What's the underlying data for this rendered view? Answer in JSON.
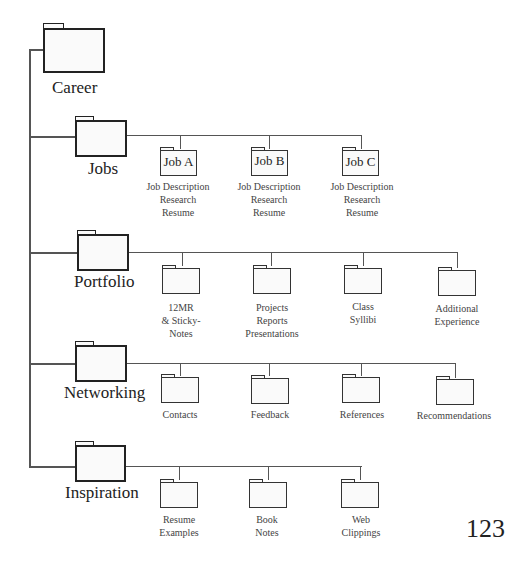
{
  "root": {
    "label": "Career"
  },
  "categories": [
    {
      "label": "Jobs",
      "children": [
        {
          "folder_label": "Job A",
          "caption": [
            "Job Description",
            "Research",
            "Resume"
          ]
        },
        {
          "folder_label": "Job B",
          "caption": [
            "Job Description",
            "Research",
            "Resume"
          ]
        },
        {
          "folder_label": "Job C",
          "caption": [
            "Job Description",
            "Research",
            "Resume"
          ]
        }
      ]
    },
    {
      "label": "Portfolio",
      "children": [
        {
          "caption": [
            "12MR",
            "& Sticky-",
            "Notes"
          ]
        },
        {
          "caption": [
            "Projects",
            "Reports",
            "Presentations"
          ]
        },
        {
          "caption": [
            "Class",
            "Syllibi"
          ]
        },
        {
          "caption": [
            "Additional",
            "Experience"
          ]
        }
      ]
    },
    {
      "label": "Networking",
      "children": [
        {
          "caption": [
            "Contacts"
          ]
        },
        {
          "caption": [
            "Feedback"
          ]
        },
        {
          "caption": [
            "References"
          ]
        },
        {
          "caption": [
            "Recommendations"
          ]
        }
      ]
    },
    {
      "label": "Inspiration",
      "children": [
        {
          "caption": [
            "Resume",
            "Examples"
          ]
        },
        {
          "caption": [
            "Book",
            "Notes"
          ]
        },
        {
          "caption": [
            "Web",
            "Clippings"
          ]
        }
      ]
    }
  ],
  "page_number": "123",
  "colors": {
    "line": "#555555",
    "folder_stroke": "#222222",
    "folder_fill": "#fafafa",
    "text": "#222222"
  }
}
